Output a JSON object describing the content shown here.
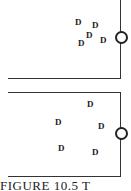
{
  "diagram": {
    "panels": [
      {
        "name": "top-panel",
        "particles": [
          {
            "label": "D",
            "x": 75,
            "y": 18
          },
          {
            "label": "D",
            "x": 92,
            "y": 21
          },
          {
            "label": "D",
            "x": 86,
            "y": 31
          },
          {
            "label": "D",
            "x": 78,
            "y": 39
          },
          {
            "label": "D",
            "x": 100,
            "y": 36
          }
        ]
      },
      {
        "name": "bottom-panel",
        "particles": [
          {
            "label": "D",
            "x": 87,
            "y": 100
          },
          {
            "label": "D",
            "x": 55,
            "y": 118
          },
          {
            "label": "D",
            "x": 98,
            "y": 122
          },
          {
            "label": "D",
            "x": 58,
            "y": 144
          },
          {
            "label": "D",
            "x": 92,
            "y": 148
          }
        ]
      }
    ],
    "caption": "FIGURE 10.5  T"
  }
}
